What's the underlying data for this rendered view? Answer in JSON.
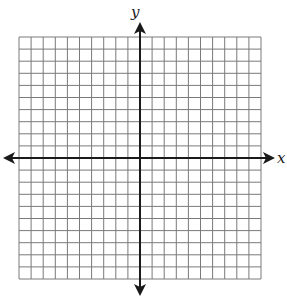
{
  "diagram": {
    "type": "coordinate-grid",
    "x_axis_label": "x",
    "y_axis_label": "y",
    "grid": {
      "columns": 20,
      "rows": 20,
      "left": 19,
      "top": 37,
      "cell": 12.1
    },
    "origin": {
      "col": 10,
      "row": 10
    },
    "colors": {
      "grid": "#7a7a7a",
      "axis": "#1a1a1a",
      "background": "#ffffff"
    }
  }
}
